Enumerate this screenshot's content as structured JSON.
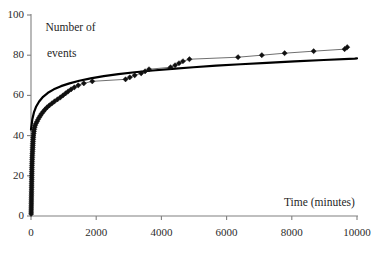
{
  "chart_data": {
    "type": "scatter",
    "title": "",
    "subtitle": "",
    "xlabel": "Time (minutes)",
    "ylabel_line1": "Number of",
    "ylabel_line2": "events",
    "xlim": [
      0,
      10000
    ],
    "ylim": [
      0,
      100
    ],
    "xticks": [
      0,
      2000,
      4000,
      6000,
      8000,
      10000
    ],
    "yticks": [
      0,
      20,
      40,
      60,
      80,
      100
    ],
    "xtick_labels": [
      "0",
      "2000",
      "4000",
      "6000",
      "8000",
      "10000"
    ],
    "ytick_labels": [
      "0",
      "20",
      "40",
      "60",
      "80",
      "100"
    ],
    "grid": false,
    "legend": "none",
    "colors": {
      "marker": "#101010",
      "data_line": "#4a4a4a",
      "fit_curve": "#000000",
      "axis": "#808080",
      "background": "#ffffff",
      "text": "#1f1f1f"
    },
    "series": [
      {
        "name": "Observed cumulative events",
        "style": "line-with-diamond-markers",
        "marker": "diamond",
        "marker_size": 4,
        "points": [
          [
            5,
            1
          ],
          [
            6,
            2
          ],
          [
            7,
            3
          ],
          [
            8,
            4
          ],
          [
            9,
            5
          ],
          [
            10,
            6
          ],
          [
            11,
            7
          ],
          [
            12,
            8
          ],
          [
            13,
            9
          ],
          [
            14,
            10
          ],
          [
            15,
            11
          ],
          [
            16,
            12
          ],
          [
            17,
            13
          ],
          [
            18,
            14
          ],
          [
            19,
            15
          ],
          [
            20,
            16
          ],
          [
            21,
            17
          ],
          [
            22,
            18
          ],
          [
            23,
            19
          ],
          [
            24,
            20
          ],
          [
            25,
            21
          ],
          [
            26,
            22
          ],
          [
            27,
            23
          ],
          [
            28,
            24
          ],
          [
            30,
            25
          ],
          [
            32,
            26
          ],
          [
            34,
            27
          ],
          [
            36,
            28
          ],
          [
            38,
            29
          ],
          [
            40,
            30
          ],
          [
            43,
            31
          ],
          [
            46,
            32
          ],
          [
            49,
            33
          ],
          [
            52,
            34
          ],
          [
            55,
            35
          ],
          [
            58,
            36
          ],
          [
            62,
            37
          ],
          [
            66,
            38
          ],
          [
            70,
            39
          ],
          [
            75,
            40
          ],
          [
            80,
            41
          ],
          [
            88,
            42
          ],
          [
            96,
            43
          ],
          [
            108,
            44
          ],
          [
            125,
            45
          ],
          [
            150,
            46
          ],
          [
            185,
            47
          ],
          [
            215,
            48
          ],
          [
            250,
            49
          ],
          [
            290,
            50
          ],
          [
            330,
            51
          ],
          [
            380,
            52
          ],
          [
            430,
            53
          ],
          [
            490,
            54
          ],
          [
            560,
            55
          ],
          [
            640,
            56
          ],
          [
            720,
            57
          ],
          [
            810,
            58
          ],
          [
            900,
            59
          ],
          [
            980,
            60
          ],
          [
            1060,
            61
          ],
          [
            1140,
            62
          ],
          [
            1230,
            63
          ],
          [
            1330,
            64
          ],
          [
            1450,
            65
          ],
          [
            1620,
            66
          ],
          [
            1880,
            67
          ],
          [
            2900,
            68
          ],
          [
            3030,
            69
          ],
          [
            3180,
            70
          ],
          [
            3380,
            71
          ],
          [
            3500,
            72
          ],
          [
            3620,
            73
          ],
          [
            4280,
            74
          ],
          [
            4420,
            75
          ],
          [
            4540,
            76
          ],
          [
            4660,
            77
          ],
          [
            4860,
            78
          ],
          [
            6350,
            79
          ],
          [
            7080,
            80
          ],
          [
            7780,
            81
          ],
          [
            8670,
            82
          ],
          [
            9620,
            83
          ],
          [
            9700,
            84
          ]
        ]
      },
      {
        "name": "Fitted logarithmic curve",
        "style": "thick-smooth-line",
        "equation_form": "y = a + b*ln(1 + x/c)",
        "fit_points": [
          [
            0,
            43.0
          ],
          [
            40,
            48.0
          ],
          [
            90,
            51.5
          ],
          [
            160,
            54.5
          ],
          [
            250,
            57.0
          ],
          [
            370,
            59.3
          ],
          [
            520,
            61.3
          ],
          [
            700,
            63.0
          ],
          [
            920,
            64.6
          ],
          [
            1180,
            66.0
          ],
          [
            1480,
            67.3
          ],
          [
            1830,
            68.5
          ],
          [
            2230,
            69.6
          ],
          [
            2680,
            70.6
          ],
          [
            3180,
            71.5
          ],
          [
            3730,
            72.4
          ],
          [
            4330,
            73.2
          ],
          [
            4980,
            74.0
          ],
          [
            5680,
            74.8
          ],
          [
            6430,
            75.5
          ],
          [
            7230,
            76.2
          ],
          [
            8080,
            76.9
          ],
          [
            8980,
            77.6
          ],
          [
            9930,
            78.3
          ],
          [
            10000,
            78.4
          ]
        ]
      }
    ]
  },
  "axes": {
    "x_axis_name": "x-axis",
    "y_axis_name": "y-axis"
  }
}
